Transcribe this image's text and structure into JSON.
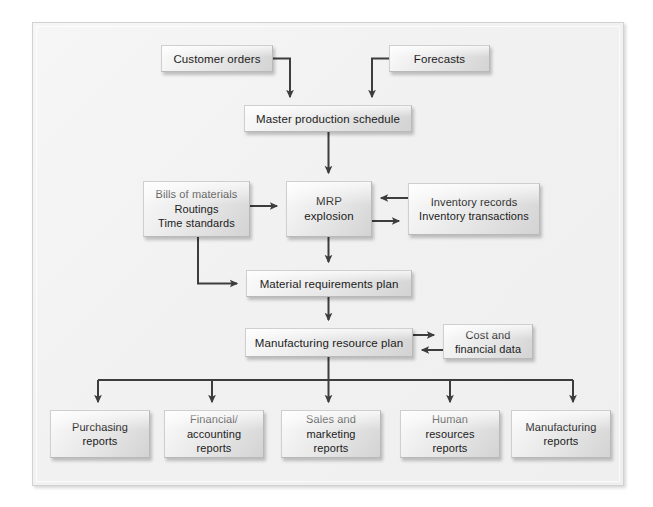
{
  "diagram": {
    "frame_color": "#f1f1f1",
    "line_color": "#4a4a4a",
    "box_fill": "#e6e6e6",
    "text_color": "#1b1b1b"
  },
  "nodes": {
    "customer_orders": "Customer orders",
    "forecasts": "Forecasts",
    "master_production_schedule": "Master production schedule",
    "bills_of_materials": "Bills of materials\nRoutings\nTime standards",
    "mrp_explosion": "MRP\nexplosion",
    "inventory_records": "Inventory records\nInventory transactions",
    "material_requirements_plan": "Material requirements plan",
    "manufacturing_resource_plan": "Manufacturing resource plan",
    "cost_and_financial_data": "Cost and\nfinancial data"
  },
  "reports": [
    {
      "label": "Purchasing\nreports"
    },
    {
      "label": "Financial/\naccounting\nreports"
    },
    {
      "label": "Sales and\nmarketing\nreports"
    },
    {
      "label": "Human\nresources\nreports"
    },
    {
      "label": "Manufacturing\nreports"
    }
  ],
  "connections": [
    {
      "from": "customer_orders",
      "to": "master_production_schedule",
      "type": "elbow-down"
    },
    {
      "from": "forecasts",
      "to": "master_production_schedule",
      "type": "elbow-down"
    },
    {
      "from": "master_production_schedule",
      "to": "mrp_explosion",
      "type": "straight-down"
    },
    {
      "from": "bills_of_materials",
      "to": "mrp_explosion",
      "type": "right"
    },
    {
      "from": "inventory_records",
      "to": "mrp_explosion",
      "type": "left"
    },
    {
      "from": "mrp_explosion",
      "to": "inventory_records",
      "type": "right"
    },
    {
      "from": "bills_of_materials",
      "to": "material_requirements_plan",
      "type": "elbow-right"
    },
    {
      "from": "mrp_explosion",
      "to": "material_requirements_plan",
      "type": "straight-down"
    },
    {
      "from": "material_requirements_plan",
      "to": "manufacturing_resource_plan",
      "type": "straight-down"
    },
    {
      "from": "manufacturing_resource_plan",
      "to": "cost_and_financial_data",
      "type": "right"
    },
    {
      "from": "cost_and_financial_data",
      "to": "manufacturing_resource_plan",
      "type": "left"
    },
    {
      "from": "manufacturing_resource_plan",
      "to": "reports",
      "type": "fan-out-5"
    }
  ]
}
